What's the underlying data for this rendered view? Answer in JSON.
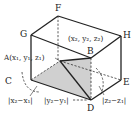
{
  "diagram": {
    "type": "rectangular-box-3d",
    "vertices": {
      "F": {
        "label": "F",
        "x": 58,
        "y": 16
      },
      "G": {
        "label": "G",
        "x": 31,
        "y": 35
      },
      "H": {
        "label": "H",
        "x": 121,
        "y": 36
      },
      "B": {
        "label": "B",
        "x": 91,
        "y": 58
      },
      "A": {
        "label": "A",
        "x": 60,
        "y": 61
      },
      "C": {
        "label": "C",
        "x": 31,
        "y": 80
      },
      "E": {
        "label": "E",
        "x": 121,
        "y": 80
      },
      "D": {
        "label": "D",
        "x": 91,
        "y": 100
      }
    },
    "labels": {
      "F": "F",
      "G": "G",
      "H": "H",
      "B": "B",
      "C": "C",
      "E": "E",
      "D": "D",
      "A_coord": "A(x₁, y₁, z₁)",
      "B_coord": "(x₂, y₂, z₂)",
      "dx": "|x₂−x₁|",
      "dy": "|y₂−y₁|",
      "dz": "|z₂−z₁|"
    },
    "colors": {
      "edge": "#222222",
      "shade": "#cfcfcf",
      "background": "#ffffff"
    }
  }
}
